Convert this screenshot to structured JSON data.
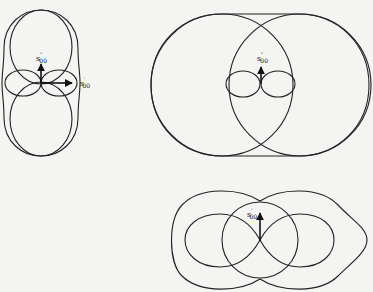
{
  "figures": [
    {
      "id": "left",
      "description": "Vertical figure-eight lobes with small horizontal lobes and peanut-shaped outer envelope",
      "labels": [
        {
          "symbol": "s",
          "prime": "″",
          "subscript": "00"
        },
        {
          "symbol": "s",
          "prime": "′",
          "subscript": "00"
        }
      ]
    },
    {
      "id": "top-right",
      "description": "Two overlapping large circles with stadium-shaped envelope and small horizontal figure-eight",
      "labels": [
        {
          "symbol": "s",
          "prime": "″",
          "subscript": "00"
        }
      ]
    },
    {
      "id": "bottom",
      "description": "Horizontal figure-eight with central circle and peanut-shaped outer envelope",
      "labels": [
        {
          "symbol": "s",
          "prime": "′",
          "subscript": "00"
        }
      ]
    }
  ],
  "colors": {
    "line": "#222222",
    "background": "#f4f4f2"
  }
}
